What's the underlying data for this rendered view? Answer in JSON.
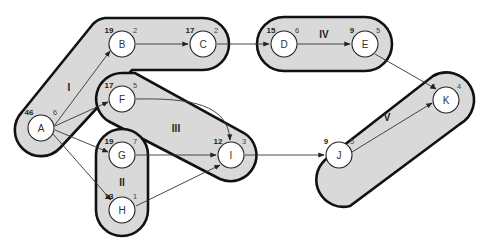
{
  "diagram": {
    "type": "task-graph-clusters",
    "groups": [
      {
        "id": "I",
        "label": "I",
        "members": [
          "A",
          "B",
          "C"
        ]
      },
      {
        "id": "II",
        "label": "II",
        "members": [
          "G",
          "H"
        ]
      },
      {
        "id": "III",
        "label": "III",
        "members": [
          "F",
          "I"
        ]
      },
      {
        "id": "IV",
        "label": "IV",
        "members": [
          "D",
          "E"
        ]
      },
      {
        "id": "V",
        "label": "V",
        "members": [
          "J",
          "K"
        ]
      }
    ],
    "nodes": [
      {
        "id": "A",
        "label": "A",
        "left": "46",
        "right": "6"
      },
      {
        "id": "B",
        "label": "B",
        "left": "19",
        "right": "2"
      },
      {
        "id": "C",
        "label": "C",
        "left": "17",
        "right": "2"
      },
      {
        "id": "D",
        "label": "D",
        "left": "15",
        "right": "6"
      },
      {
        "id": "E",
        "label": "E",
        "left": "9",
        "right": "5"
      },
      {
        "id": "F",
        "label": "F",
        "left": "17",
        "right": "5"
      },
      {
        "id": "G",
        "label": "G",
        "left": "19",
        "right": "7"
      },
      {
        "id": "H",
        "label": "H",
        "left": "13",
        "right": "1"
      },
      {
        "id": "I",
        "label": "I",
        "left": "12",
        "right": "3"
      },
      {
        "id": "J",
        "label": "J",
        "left": "9",
        "right": "5"
      },
      {
        "id": "K",
        "label": "K",
        "left": "4",
        "right": "4"
      }
    ],
    "edges": [
      [
        "A",
        "B"
      ],
      [
        "A",
        "F"
      ],
      [
        "A",
        "G"
      ],
      [
        "A",
        "H"
      ],
      [
        "B",
        "C"
      ],
      [
        "C",
        "D"
      ],
      [
        "D",
        "E"
      ],
      [
        "E",
        "K"
      ],
      [
        "F",
        "I"
      ],
      [
        "G",
        "I"
      ],
      [
        "H",
        "I"
      ],
      [
        "I",
        "J"
      ],
      [
        "J",
        "K"
      ]
    ]
  }
}
